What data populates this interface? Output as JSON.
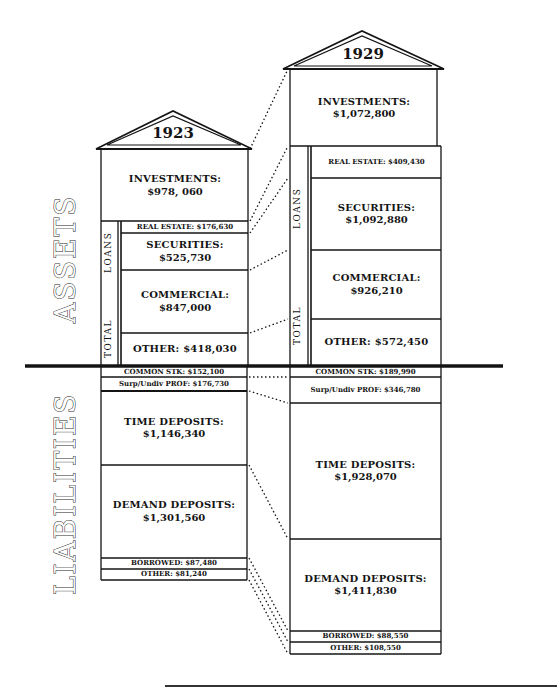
{
  "side_labels": {
    "assets": "ASSETS",
    "liabilities": "LIABILITIES"
  },
  "columns": {
    "y1923": {
      "year": "1923",
      "loans_label": "LOANS",
      "total_label": "TOTAL",
      "assets": {
        "investments": {
          "label": "INVESTMENTS:",
          "value": "$978, 060"
        },
        "real_estate": {
          "text": "REAL ESTATE: $176,630"
        },
        "securities": {
          "label": "SECURITIES:",
          "value": "$525,730"
        },
        "commercial": {
          "label": "COMMERCIAL:",
          "value": "$847,000"
        },
        "other": {
          "text": "OTHER: $418,030"
        }
      },
      "liabilities": {
        "common_stock": {
          "text": "COMMON STK: $152,100"
        },
        "surplus": {
          "text": "Surp/Undiv PROF: $176,730"
        },
        "time_deposits": {
          "label": "TIME DEPOSITS:",
          "value": "$1,146,340"
        },
        "demand_deposits": {
          "label": "DEMAND DEPOSITS:",
          "value": "$1,301,560"
        },
        "borrowed": {
          "text": "BORROWED: $87,480"
        },
        "other": {
          "text": "OTHER: $81,240"
        }
      }
    },
    "y1929": {
      "year": "1929",
      "loans_label": "LOANS",
      "total_label": "TOTAL",
      "assets": {
        "investments": {
          "label": "INVESTMENTS:",
          "value": "$1,072,800"
        },
        "real_estate": {
          "text": "REAL ESTATE: $409,430"
        },
        "securities": {
          "label": "SECURITIES:",
          "value": "$1,092,880"
        },
        "commercial": {
          "label": "COMMERCIAL:",
          "value": "$926,210"
        },
        "other": {
          "text": "OTHER: $572,450"
        }
      },
      "liabilities": {
        "common_stock": {
          "text": "COMMON STK: $189,990"
        },
        "surplus": {
          "text": "Surp/Undiv PROF: $346,780"
        },
        "time_deposits": {
          "label": "TIME DEPOSITS:",
          "value": "$1,928,070"
        },
        "demand_deposits": {
          "label": "DEMAND DEPOSITS:",
          "value": "$1,411,830"
        },
        "borrowed": {
          "text": "BORROWED: $88,550"
        },
        "other": {
          "text": "OTHER: $108,550"
        }
      }
    }
  },
  "colors": {
    "ink": "#141414",
    "paper": "#ffffff"
  }
}
